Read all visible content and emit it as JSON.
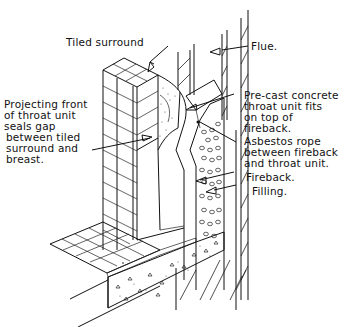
{
  "diagram": {
    "labels": [
      {
        "id": "tiled-surround",
        "text": "Tiled surround",
        "lines": [
          "Tiled surround"
        ]
      },
      {
        "id": "flue",
        "text": "Flue.",
        "lines": [
          "Flue."
        ]
      },
      {
        "id": "precast-throat",
        "text": "Pre-cast concrete throat unit fits on top of fireback.",
        "lines": [
          "Pre-cast concrete",
          "throat unit fits",
          "on top of",
          "fireback."
        ]
      },
      {
        "id": "projecting-front",
        "text": "Projecting front of throat unit seals gap between tiled surround and breast.",
        "lines": [
          "Projecting front",
          "of throat unit",
          "seals gap",
          "between tiled",
          "surround and",
          "breast."
        ]
      },
      {
        "id": "asbestos-rope",
        "text": "Asbestos rope between fireback and throat unit.",
        "lines": [
          "Asbestos rope",
          "between fireback",
          "and throat unit."
        ]
      },
      {
        "id": "fireback",
        "text": "Fireback.",
        "lines": [
          "Fireback."
        ]
      },
      {
        "id": "filling",
        "text": "Filling.",
        "lines": [
          "Filling."
        ]
      }
    ],
    "components": [
      "tiled surround",
      "flue",
      "pre-cast concrete throat unit",
      "fireback",
      "filling",
      "asbestos rope",
      "tiled hearth",
      "concrete hearth slab",
      "chimney breast brickwork"
    ]
  }
}
